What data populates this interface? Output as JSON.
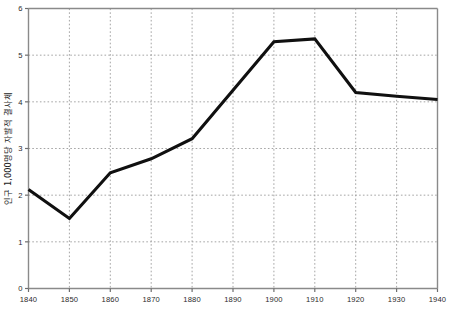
{
  "chart_data": {
    "type": "line",
    "title": "",
    "xlabel": "",
    "ylabel": "인구 1,000명당 자발적 결사체",
    "x": [
      1840,
      1850,
      1860,
      1870,
      1880,
      1890,
      1900,
      1910,
      1920,
      1930,
      1940
    ],
    "categories": [
      "1840",
      "1850",
      "1860",
      "1870",
      "1880",
      "1890",
      "1900",
      "1910",
      "1920",
      "1930",
      "1940"
    ],
    "values": [
      2.12,
      1.5,
      2.48,
      2.78,
      3.21,
      4.25,
      5.29,
      5.35,
      4.2,
      4.12,
      4.05
    ],
    "series": [
      {
        "name": "인구 1,000명당 자발적 결사체",
        "values": [
          2.12,
          1.5,
          2.48,
          2.78,
          3.21,
          4.25,
          5.29,
          5.35,
          4.2,
          4.12,
          4.05
        ]
      }
    ],
    "xlim": [
      1840,
      1940
    ],
    "ylim": [
      0,
      6
    ],
    "x_ticks": [
      1840,
      1850,
      1860,
      1870,
      1880,
      1890,
      1900,
      1910,
      1920,
      1930,
      1940
    ],
    "x_tick_labels": [
      "1840",
      "1850",
      "1860",
      "1870",
      "1880",
      "1890",
      "1900",
      "1910",
      "1920",
      "1930",
      "1940"
    ],
    "y_ticks": [
      0,
      1,
      2,
      3,
      4,
      5,
      6
    ],
    "y_tick_labels": [
      "0",
      "1",
      "2",
      "3",
      "4",
      "5",
      "6"
    ],
    "grid": true,
    "grid_style": "dotted",
    "legend": false,
    "legend_position": "none",
    "line_color": "#101010",
    "grid_color": "#9a9a9a",
    "axis_color": "#8a8a8a",
    "background_color": "#ffffff"
  }
}
